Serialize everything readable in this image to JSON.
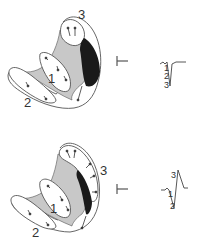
{
  "colors": {
    "outline": "#555555",
    "fill_gray": "#c8c8c8",
    "fill_black": "#1a1a1a",
    "background": "#ffffff"
  },
  "panels": [
    {
      "id": "top",
      "region_labels": {
        "one": "1",
        "two": "2",
        "three": "3"
      },
      "lead_symbol": "lead-electrode",
      "ecg": {
        "type": "QS complex",
        "labels": [
          "1",
          "2",
          "3"
        ]
      }
    },
    {
      "id": "bottom",
      "region_labels": {
        "one": "1",
        "two": "2",
        "three": "3"
      },
      "lead_symbol": "lead-electrode",
      "ecg": {
        "type": "rS / R complex",
        "labels": [
          "3",
          "1",
          "2"
        ]
      }
    }
  ]
}
